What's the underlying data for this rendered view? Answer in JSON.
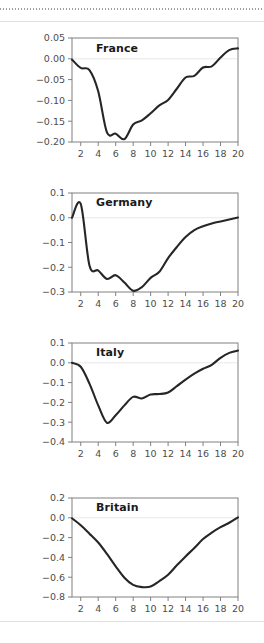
{
  "figure": {
    "background_color": "#ffffff",
    "line_color": "#262626",
    "axis_color": "#808080",
    "tick_label_color": "#4d4d4d",
    "zero_line_color": "#e8e8e8",
    "top_rule_style": "dotted",
    "x_ticks": [
      2,
      4,
      6,
      8,
      10,
      12,
      14,
      16,
      18,
      20
    ],
    "x_range": [
      1,
      20
    ]
  },
  "chart_data": [
    {
      "type": "line",
      "title": "France",
      "xlabel": "",
      "ylabel": "",
      "xlim": [
        1,
        20
      ],
      "ylim": [
        -0.2,
        0.05
      ],
      "grid": false,
      "legend": "none",
      "x_ticks": [
        2,
        4,
        6,
        8,
        10,
        12,
        14,
        16,
        18,
        20
      ],
      "y_ticks": [
        0.05,
        0.0,
        -0.05,
        -0.1,
        -0.15,
        -0.2
      ],
      "y_tick_labels": [
        "0.05",
        "0.00",
        "−0.05",
        "−0.10",
        "−0.15",
        "−0.20"
      ],
      "x": [
        1,
        2,
        3,
        4,
        5,
        6,
        7,
        8,
        9,
        10,
        11,
        12,
        13,
        14,
        15,
        16,
        17,
        18,
        19,
        20
      ],
      "values": [
        -0.002,
        -0.022,
        -0.027,
        -0.078,
        -0.177,
        -0.18,
        -0.193,
        -0.158,
        -0.148,
        -0.131,
        -0.112,
        -0.099,
        -0.072,
        -0.045,
        -0.041,
        -0.021,
        -0.018,
        0.003,
        0.021,
        0.025
      ]
    },
    {
      "type": "line",
      "title": "Germany",
      "xlabel": "",
      "ylabel": "",
      "xlim": [
        1,
        20
      ],
      "ylim": [
        -0.3,
        0.1
      ],
      "grid": false,
      "legend": "none",
      "x_ticks": [
        2,
        4,
        6,
        8,
        10,
        12,
        14,
        16,
        18,
        20
      ],
      "y_ticks": [
        0.1,
        0.0,
        -0.1,
        -0.2,
        -0.3
      ],
      "y_tick_labels": [
        "0.1",
        "0.0",
        "−0.1",
        "−0.2",
        "−0.3"
      ],
      "x": [
        1,
        2,
        3,
        4,
        5,
        6,
        7,
        8,
        9,
        10,
        11,
        12,
        13,
        14,
        15,
        16,
        17,
        18,
        19,
        20
      ],
      "values": [
        0.0,
        0.056,
        -0.193,
        -0.213,
        -0.247,
        -0.232,
        -0.262,
        -0.295,
        -0.28,
        -0.243,
        -0.218,
        -0.163,
        -0.118,
        -0.078,
        -0.05,
        -0.034,
        -0.023,
        -0.015,
        -0.007,
        0.001
      ]
    },
    {
      "type": "line",
      "title": "Italy",
      "xlabel": "",
      "ylabel": "",
      "xlim": [
        1,
        20
      ],
      "ylim": [
        -0.4,
        0.1
      ],
      "grid": false,
      "legend": "none",
      "x_ticks": [
        2,
        4,
        6,
        8,
        10,
        12,
        14,
        16,
        18,
        20
      ],
      "y_ticks": [
        0.1,
        0.0,
        -0.1,
        -0.2,
        -0.3,
        -0.4
      ],
      "y_tick_labels": [
        "0.1",
        "0.0",
        "−0.1",
        "−0.2",
        "−0.3",
        "−0.4"
      ],
      "x": [
        1,
        2,
        3,
        4,
        5,
        6,
        7,
        8,
        9,
        10,
        11,
        12,
        13,
        14,
        15,
        16,
        17,
        18,
        19,
        20
      ],
      "values": [
        0.0,
        -0.02,
        -0.105,
        -0.215,
        -0.303,
        -0.265,
        -0.215,
        -0.172,
        -0.18,
        -0.16,
        -0.158,
        -0.15,
        -0.118,
        -0.085,
        -0.055,
        -0.03,
        -0.01,
        0.025,
        0.05,
        0.062
      ]
    },
    {
      "type": "line",
      "title": "Britain",
      "xlabel": "",
      "ylabel": "",
      "xlim": [
        1,
        20
      ],
      "ylim": [
        -0.8,
        0.2
      ],
      "grid": false,
      "legend": "none",
      "x_ticks": [
        2,
        4,
        6,
        8,
        10,
        12,
        14,
        16,
        18,
        20
      ],
      "y_ticks": [
        0.2,
        0.0,
        -0.2,
        -0.4,
        -0.6,
        -0.8
      ],
      "y_tick_labels": [
        "0.2",
        "0.0",
        "−0.2",
        "−0.4",
        "−0.6",
        "−0.8"
      ],
      "x": [
        1,
        2,
        3,
        4,
        5,
        6,
        7,
        8,
        9,
        10,
        11,
        12,
        13,
        14,
        15,
        16,
        17,
        18,
        19,
        20
      ],
      "values": [
        -0.005,
        -0.075,
        -0.16,
        -0.25,
        -0.365,
        -0.49,
        -0.605,
        -0.678,
        -0.7,
        -0.695,
        -0.64,
        -0.575,
        -0.48,
        -0.39,
        -0.305,
        -0.215,
        -0.15,
        -0.095,
        -0.05,
        0.005
      ]
    }
  ]
}
